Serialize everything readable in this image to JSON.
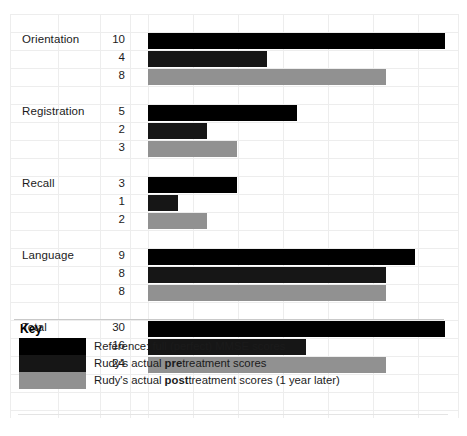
{
  "chart_data": {
    "type": "bar",
    "title": "",
    "orientation": "horizontal",
    "xlabel": "",
    "ylabel": "",
    "xlim": [
      0,
      30
    ],
    "grid": true,
    "legend_position": "bottom-left",
    "categories": [
      "Orientation",
      "Registration",
      "Recall",
      "Language",
      "Total (Scaled)"
    ],
    "series": [
      {
        "name": "Reference: full (perfect) MMSE scores",
        "color": "#000000",
        "values": [
          10,
          5,
          3,
          9,
          30
        ]
      },
      {
        "name": "Rudy's actual pretreatment scores",
        "color": "#161616",
        "values": [
          4,
          2,
          1,
          8,
          16
        ]
      },
      {
        "name": "Rudy's actual posttreatment scores (1 year later)",
        "color": "#919191",
        "values": [
          8,
          3,
          2,
          8,
          24
        ]
      }
    ],
    "groups": [
      {
        "label": "Orientation",
        "label2": "",
        "rows": [
          {
            "value": 10,
            "series": "reference",
            "scale_max": 10
          },
          {
            "value": 4,
            "series": "pre",
            "scale_max": 10
          },
          {
            "value": 8,
            "series": "post",
            "scale_max": 10
          }
        ]
      },
      {
        "label": "Registration",
        "label2": "",
        "rows": [
          {
            "value": 5,
            "series": "reference",
            "scale_max": 10
          },
          {
            "value": 2,
            "series": "pre",
            "scale_max": 10
          },
          {
            "value": 3,
            "series": "post",
            "scale_max": 10
          }
        ]
      },
      {
        "label": "Recall",
        "label2": "",
        "rows": [
          {
            "value": 3,
            "series": "reference",
            "scale_max": 10
          },
          {
            "value": 1,
            "series": "pre",
            "scale_max": 10
          },
          {
            "value": 2,
            "series": "post",
            "scale_max": 10
          }
        ]
      },
      {
        "label": "Language",
        "label2": "",
        "rows": [
          {
            "value": 9,
            "series": "reference",
            "scale_max": 10
          },
          {
            "value": 8,
            "series": "pre",
            "scale_max": 10
          },
          {
            "value": 8,
            "series": "post",
            "scale_max": 10
          }
        ]
      },
      {
        "label": "Total",
        "label2": "(Scaled)",
        "rows": [
          {
            "value": 30,
            "series": "reference",
            "scale_max": 30
          },
          {
            "value": 16,
            "series": "pre",
            "scale_max": 30
          },
          {
            "value": 24,
            "series": "post",
            "scale_max": 30
          }
        ]
      }
    ]
  },
  "key": {
    "title": "Key",
    "entries": [
      {
        "swatch": "reference",
        "text_before": "Reference: full (perfect) MMSE scores",
        "bold": "",
        "text_after": ""
      },
      {
        "swatch": "pre",
        "text_before": "Rudy's actual ",
        "bold": "pre",
        "text_after": "treatment scores"
      },
      {
        "swatch": "post",
        "text_before": "Rudy's actual ",
        "bold": "post",
        "text_after": "treatment scores (1 year later)"
      }
    ]
  },
  "colors": {
    "reference": "#000000",
    "pre": "#161616",
    "post": "#919191",
    "grid": "#ededed",
    "text": "#1b1b1b"
  }
}
